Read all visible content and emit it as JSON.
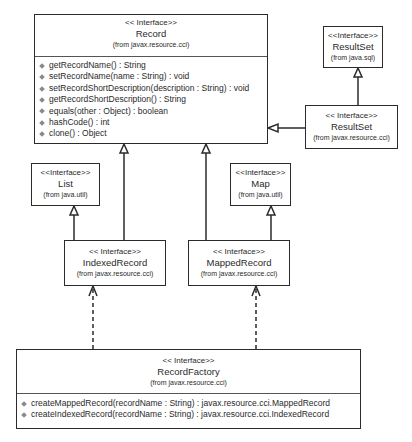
{
  "diagram": {
    "type": "UML class diagram",
    "classes": {
      "record": {
        "stereotype": "<< Interface>>",
        "name": "Record",
        "package": "(from javax.resource.cci)",
        "operations": [
          "getRecordName() : String",
          "setRecordName(name : String) : void",
          "setRecordShortDescription(description : String) : void",
          "getRecordShortDescription() : String",
          "equals(other : Object) : boolean",
          "hashCode() : int",
          "clone() : Object"
        ]
      },
      "resultset_sql": {
        "stereotype": "<<Interface>>",
        "name": "ResultSet",
        "package": "(from java.sql)"
      },
      "resultset_cci": {
        "stereotype": "<< Interface>>",
        "name": "ResultSet",
        "package": "(from javax.resource.cci)"
      },
      "list": {
        "stereotype": "<<Interface>>",
        "name": "List",
        "package": "(from java.util)"
      },
      "map": {
        "stereotype": "<<Interface>>",
        "name": "Map",
        "package": "(from java.util)"
      },
      "indexed_record": {
        "stereotype": "<< Interface>>",
        "name": "IndexedRecord",
        "package": "(from javax.resource.cci)"
      },
      "mapped_record": {
        "stereotype": "<< Interface>>",
        "name": "MappedRecord",
        "package": "(from javax.resource.cci)"
      },
      "record_factory": {
        "stereotype": "<< Interface>>",
        "name": "RecordFactory",
        "package": "(from javax.resource.cci)",
        "operations": [
          "createMappedRecord(recordName : String) : javax.resource.cci.MappedRecord",
          "createIndexedRecord(recordName : String) : javax.resource.cci.IndexedRecord"
        ]
      }
    },
    "relationships": [
      {
        "type": "generalization",
        "from": "ResultSet (javax.resource.cci)",
        "to": "Record"
      },
      {
        "type": "generalization",
        "from": "ResultSet (javax.resource.cci)",
        "to": "ResultSet (java.sql)"
      },
      {
        "type": "generalization",
        "from": "IndexedRecord",
        "to": "Record"
      },
      {
        "type": "generalization",
        "from": "IndexedRecord",
        "to": "List"
      },
      {
        "type": "generalization",
        "from": "MappedRecord",
        "to": "Record"
      },
      {
        "type": "generalization",
        "from": "MappedRecord",
        "to": "Map"
      },
      {
        "type": "dependency",
        "from": "RecordFactory",
        "to": "IndexedRecord"
      },
      {
        "type": "dependency",
        "from": "RecordFactory",
        "to": "MappedRecord"
      }
    ],
    "colors": {
      "line": "#2b2b2b",
      "text": "#2a2a2a",
      "op_icon": "#8a8a8a",
      "background": "#ffffff"
    }
  }
}
